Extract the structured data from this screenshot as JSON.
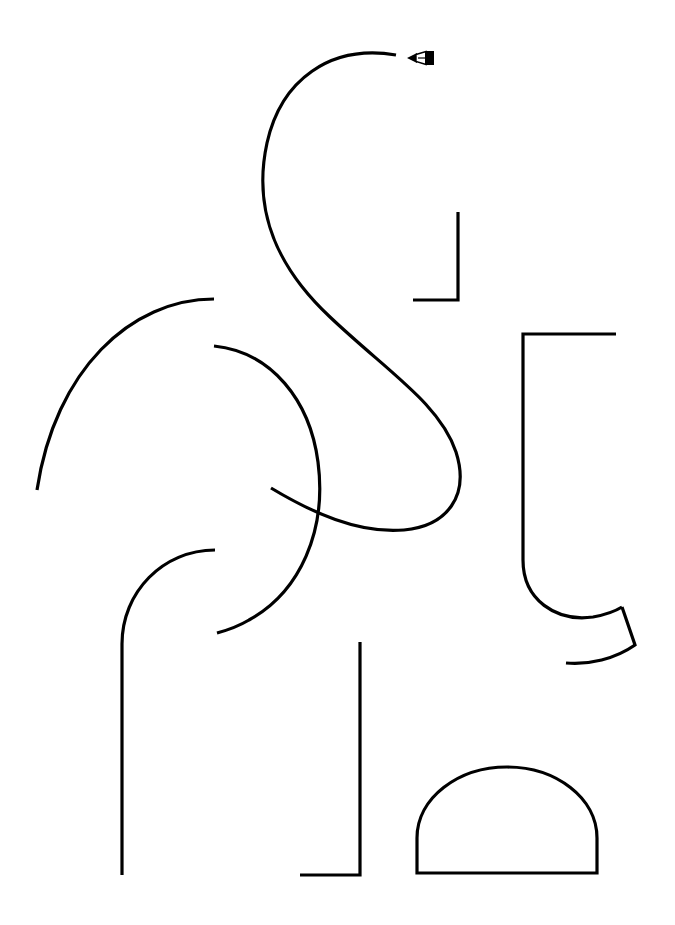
{
  "canvas": {
    "width": 675,
    "height": 925,
    "background_color": "#ffffff",
    "stroke_color": "#000000",
    "title": "Untitled Vector Drawing"
  },
  "cursor": {
    "name": "pen-tool-cursor",
    "x": 406,
    "y": 47,
    "label": "Pen tool",
    "color": "#000000"
  },
  "shapes": [
    {
      "id": "s-curve",
      "label": "Large S curve",
      "type": "path",
      "stroke_width": 3.2,
      "d": "M 396 55 C 330 44 281 80 267 143 C 251 216 282 272 330 317 C 388 372 440 404 456 452 C 470 496 447 526 404 530 C 358 534 311 512 271 488"
    },
    {
      "id": "p-curve",
      "label": "Open P loop",
      "type": "path",
      "stroke_width": 3.2,
      "d": "M 214 346 C 272 352 310 401 318 462 C 327 531 300 592 249 620 C 239 626 228 630 217 633"
    },
    {
      "id": "quarter-arc-left",
      "label": "Upper left quarter arc",
      "type": "path",
      "stroke_width": 3.2,
      "d": "M 214 299 C 131 299 55 370 37 490"
    },
    {
      "id": "rounded-corner-left",
      "label": "Rounded corner with long leg",
      "type": "path",
      "stroke_width": 3.2,
      "d": "M 215 550 C 163 550 122 592 122 644 L 122 875"
    },
    {
      "id": "corner-top-right",
      "label": "Top right angle bracket",
      "type": "path",
      "stroke_width": 3.2,
      "d": "M 458 212 L 458 300 L 413 300"
    },
    {
      "id": "corner-bottom-center",
      "label": "Bottom center angle bracket",
      "type": "path",
      "stroke_width": 3.2,
      "d": "M 360 642 L 360 875 L 300 875"
    },
    {
      "id": "j-hook-right",
      "label": "Right J hook",
      "type": "path",
      "stroke_width": 3.2,
      "d": "M 616 334 L 523 334 L 523 560 C 523 600 556 622 593 617 C 604 615 614 612 622 607"
    },
    {
      "id": "hook-tail-right",
      "label": "J hook angled tail",
      "type": "path",
      "stroke_width": 3.2,
      "d": "M 622 607 L 635 645 C 615 659 589 665 566 663"
    },
    {
      "id": "dome",
      "label": "Semicircular dome",
      "type": "path",
      "stroke_width": 3.2,
      "d": "M 417 873 L 417 838 C 417 798 458 767 507 767 C 556 767 597 798 597 838 L 597 873 Z"
    }
  ]
}
